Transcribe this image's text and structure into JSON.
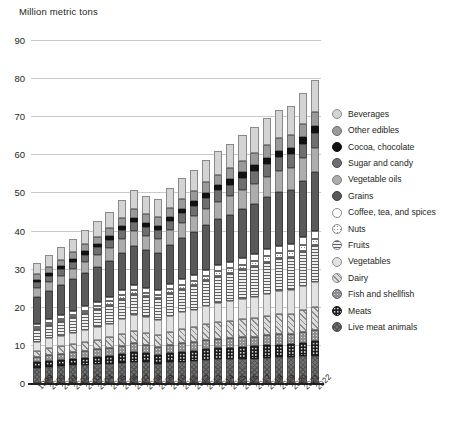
{
  "chart_data": {
    "type": "bar",
    "subtype": "stacked-bar",
    "title": "",
    "ylabel": "Million metric tons",
    "xlabel": "",
    "ylim": [
      0,
      90
    ],
    "ytick_step": 10,
    "yticks": [
      "0",
      "10",
      "20",
      "30",
      "40",
      "50",
      "60",
      "70",
      "80",
      "90"
    ],
    "grid": true,
    "legend_position": "right",
    "categories": [
      "1999",
      "2000",
      "2001",
      "2002",
      "2003",
      "2004",
      "2005",
      "2006",
      "2007",
      "2008",
      "2009",
      "2010",
      "2011",
      "2012",
      "2013",
      "2014",
      "2015",
      "2016",
      "2017",
      "2018",
      "2019",
      "2020",
      "2021",
      "2022"
    ],
    "series": [
      {
        "name": "Live meat animals",
        "key": "liveanimals",
        "color": "#707070",
        "values": [
          4.0,
          4.2,
          4.4,
          4.6,
          4.7,
          4.9,
          5.1,
          5.3,
          5.6,
          5.4,
          5.1,
          5.4,
          5.6,
          5.8,
          6.0,
          6.2,
          6.2,
          6.3,
          6.4,
          6.6,
          6.7,
          6.8,
          7.0,
          7.2
        ]
      },
      {
        "name": "Meats",
        "key": "meats",
        "color": "#1c1c1c",
        "values": [
          1.4,
          1.5,
          1.6,
          1.7,
          1.8,
          2.0,
          2.1,
          2.3,
          2.5,
          2.4,
          2.3,
          2.5,
          2.6,
          2.7,
          2.8,
          2.9,
          3.0,
          3.1,
          3.2,
          3.3,
          3.4,
          3.4,
          3.6,
          3.8
        ]
      },
      {
        "name": "Fish and shellfish",
        "key": "fish",
        "color": "#8f8f8f",
        "values": [
          1.5,
          1.6,
          1.7,
          1.8,
          1.9,
          2.0,
          2.1,
          2.2,
          2.3,
          2.2,
          2.1,
          2.2,
          2.3,
          2.3,
          2.4,
          2.5,
          2.5,
          2.6,
          2.6,
          2.7,
          2.7,
          2.6,
          2.8,
          2.9
        ]
      },
      {
        "name": "Dairy",
        "key": "dairy",
        "color": "#dddddd",
        "values": [
          1.6,
          1.8,
          1.9,
          2.1,
          2.3,
          2.5,
          2.7,
          3.0,
          3.3,
          3.2,
          3.1,
          3.4,
          3.7,
          3.9,
          4.2,
          4.4,
          4.5,
          4.7,
          4.9,
          5.1,
          5.3,
          5.4,
          5.7,
          6.0
        ]
      },
      {
        "name": "Vegetables",
        "key": "vegetables",
        "color": "#e2e2e2",
        "values": [
          2.4,
          2.6,
          2.8,
          3.0,
          3.2,
          3.4,
          3.6,
          3.9,
          4.1,
          4.0,
          4.0,
          4.2,
          4.4,
          4.6,
          4.8,
          5.0,
          5.2,
          5.4,
          5.6,
          5.8,
          6.0,
          6.1,
          6.4,
          6.7
        ]
      },
      {
        "name": "Fruits",
        "key": "fruits",
        "color": "#efefef",
        "values": [
          3.2,
          3.5,
          3.8,
          4.1,
          4.4,
          4.7,
          5.0,
          5.4,
          5.7,
          5.6,
          5.6,
          5.9,
          6.2,
          6.5,
          6.8,
          7.1,
          7.4,
          7.7,
          8.0,
          8.3,
          8.6,
          8.8,
          9.2,
          9.6
        ]
      },
      {
        "name": "Nuts",
        "key": "nuts",
        "color": "#fbfbfb",
        "values": [
          0.5,
          0.5,
          0.6,
          0.6,
          0.7,
          0.7,
          0.8,
          0.9,
          0.9,
          0.9,
          0.9,
          1.0,
          1.0,
          1.1,
          1.2,
          1.2,
          1.3,
          1.3,
          1.4,
          1.5,
          1.5,
          1.5,
          1.6,
          1.7
        ]
      },
      {
        "name": "Coffee, tea, and spices",
        "key": "coffee",
        "color": "#ffffff",
        "values": [
          1.0,
          1.0,
          1.1,
          1.1,
          1.2,
          1.2,
          1.3,
          1.3,
          1.4,
          1.3,
          1.3,
          1.4,
          1.4,
          1.5,
          1.5,
          1.6,
          1.6,
          1.7,
          1.7,
          1.8,
          1.8,
          1.8,
          1.9,
          2.0
        ]
      },
      {
        "name": "Grains",
        "key": "grains",
        "color": "#5a5a5a",
        "values": [
          7.0,
          7.4,
          7.8,
          8.2,
          8.6,
          9.0,
          9.4,
          9.9,
          10.3,
          10.0,
          9.8,
          10.3,
          10.8,
          11.2,
          11.7,
          12.1,
          12.5,
          12.9,
          13.3,
          13.7,
          14.1,
          14.3,
          14.9,
          15.5
        ]
      },
      {
        "name": "Vegetable oils",
        "key": "vegoils",
        "color": "#adadad",
        "values": [
          2.2,
          2.4,
          2.5,
          2.7,
          2.9,
          3.1,
          3.3,
          3.5,
          3.7,
          3.6,
          3.6,
          3.8,
          4.0,
          4.2,
          4.4,
          4.6,
          4.8,
          5.0,
          5.2,
          5.4,
          5.6,
          5.7,
          6.0,
          6.3
        ]
      },
      {
        "name": "Sugar and candy",
        "key": "sugar",
        "color": "#6f6f6f",
        "values": [
          1.6,
          1.7,
          1.8,
          1.9,
          2.0,
          2.1,
          2.2,
          2.4,
          2.5,
          2.4,
          2.4,
          2.5,
          2.6,
          2.7,
          2.9,
          3.0,
          3.1,
          3.2,
          3.3,
          3.4,
          3.5,
          3.6,
          3.7,
          3.9
        ]
      },
      {
        "name": "Cocoa, chocolate",
        "key": "cocoa",
        "color": "#111111",
        "values": [
          0.7,
          0.7,
          0.8,
          0.8,
          0.9,
          0.9,
          1.0,
          1.0,
          1.1,
          1.1,
          1.1,
          1.1,
          1.2,
          1.2,
          1.3,
          1.3,
          1.4,
          1.4,
          1.5,
          1.5,
          1.6,
          1.6,
          1.7,
          1.8
        ]
      },
      {
        "name": "Other edibles",
        "key": "other",
        "color": "#9a9a9a",
        "values": [
          1.4,
          1.5,
          1.6,
          1.7,
          1.8,
          1.9,
          2.0,
          2.2,
          2.3,
          2.2,
          2.2,
          2.3,
          2.5,
          2.6,
          2.7,
          2.8,
          2.9,
          3.0,
          3.2,
          3.3,
          3.4,
          3.5,
          3.6,
          3.8
        ]
      },
      {
        "name": "Beverages",
        "key": "beverages",
        "color": "#d4d4d4",
        "values": [
          3.0,
          3.2,
          3.4,
          3.6,
          3.9,
          4.1,
          4.4,
          4.7,
          5.0,
          4.9,
          4.9,
          5.1,
          5.4,
          5.7,
          5.9,
          6.2,
          6.4,
          6.7,
          7.0,
          7.2,
          7.5,
          7.6,
          7.9,
          8.3
        ]
      }
    ],
    "totals": [
      31.5,
      33.6,
      35.8,
      37.8,
      40.3,
      42.5,
      44.9,
      47.9,
      50.7,
      49.2,
      48.4,
      51.1,
      53.7,
      56.0,
      58.6,
      60.9,
      62.8,
      65.0,
      67.3,
      69.6,
      71.7,
      72.7,
      76.0,
      79.5
    ]
  },
  "legend": {
    "items": [
      {
        "label": "Beverages",
        "key": "beverages"
      },
      {
        "label": "Other edibles",
        "key": "other"
      },
      {
        "label": "Cocoa, chocolate",
        "key": "cocoa"
      },
      {
        "label": "Sugar and candy",
        "key": "sugar"
      },
      {
        "label": "Vegetable oils",
        "key": "vegoils"
      },
      {
        "label": "Grains",
        "key": "grains"
      },
      {
        "label": "Coffee, tea, and spices",
        "key": "coffee"
      },
      {
        "label": "Nuts",
        "key": "nuts"
      },
      {
        "label": "Fruits",
        "key": "fruits"
      },
      {
        "label": "Vegetables",
        "key": "vegetables"
      },
      {
        "label": "Dairy",
        "key": "dairy"
      },
      {
        "label": "Fish and shellfish",
        "key": "fish"
      },
      {
        "label": "Meats",
        "key": "meats"
      },
      {
        "label": "Live meat animals",
        "key": "liveanimals"
      }
    ]
  }
}
